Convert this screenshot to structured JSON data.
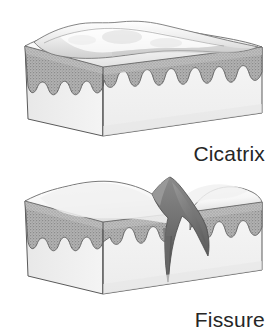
{
  "figure_set": {
    "title": "Skin lesion cross-section illustrations",
    "background_color": "#ffffff",
    "palette": {
      "outline": "#4a4a4a",
      "outline_soft": "#6e6e6e",
      "epidermis_stipple": "#a9a9a9",
      "epidermis_stipple_dark": "#8e8e8e",
      "dermis_fill": "#f3f3f3",
      "top_surface": "#fbfbfb",
      "top_surface_shade": "#dcdcdc",
      "side_face": "#efefef",
      "fissure_dark": "#6b6b6b",
      "fissure_darkest": "#4f4f4f",
      "caption_color": "#262626"
    },
    "figures": [
      {
        "id": "cicatrix",
        "caption": "Cicatrix",
        "description": "Three-dimensional block of skin with a raised, smooth, irregular scar ridge running across the top surface; epidermis shown as a stippled gray band with scalloped rete ridges above a pale dermis.",
        "features": [
          "raised wavy scar ridge on top surface",
          "stippled epidermal band",
          "scalloped rete ridge boundary",
          "pale dermal block"
        ]
      },
      {
        "id": "fissure",
        "caption": "Fissure",
        "description": "Three-dimensional block of skin interrupted by a deep, dark, wedge-shaped cleft that splits the epidermis and extends down into the dermis.",
        "features": [
          "deep V-shaped vertical cleft",
          "dark shaded fissure walls",
          "split epidermal band",
          "scalloped rete ridge boundary",
          "pale dermal block"
        ]
      }
    ]
  }
}
